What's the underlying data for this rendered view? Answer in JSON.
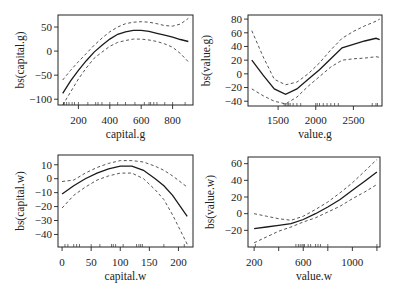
{
  "chart_data": [
    {
      "type": "line",
      "panel": "top-left",
      "title": "",
      "xlabel": "capital.g",
      "ylabel": "bs(capital.g)",
      "xticks": [
        200,
        400,
        600,
        800
      ],
      "yticks": [
        -100,
        -50,
        0,
        50
      ],
      "xlim": [
        70,
        930
      ],
      "ylim": [
        -112,
        75
      ],
      "grid": false,
      "series": [
        {
          "name": "fit",
          "x": [
            100,
            150,
            200,
            250,
            300,
            350,
            400,
            450,
            500,
            550,
            600,
            650,
            700,
            750,
            800,
            850,
            900
          ],
          "values": [
            -88,
            -62,
            -40,
            -20,
            -2,
            12,
            25,
            35,
            40,
            43,
            43,
            41,
            37,
            33,
            29,
            24,
            20
          ]
        },
        {
          "name": "upper",
          "x": [
            100,
            150,
            200,
            250,
            300,
            350,
            400,
            450,
            500,
            550,
            600,
            650,
            700,
            750,
            800,
            850,
            900
          ],
          "values": [
            -60,
            -40,
            -22,
            -5,
            12,
            27,
            40,
            50,
            57,
            60,
            61,
            60,
            57,
            53,
            52,
            56,
            68
          ]
        },
        {
          "name": "lower",
          "x": [
            100,
            150,
            200,
            250,
            300,
            350,
            400,
            450,
            500,
            550,
            600,
            650,
            700,
            750,
            800,
            850,
            900
          ],
          "values": [
            -112,
            -85,
            -58,
            -35,
            -15,
            -2,
            10,
            18,
            22,
            25,
            25,
            23,
            20,
            15,
            8,
            -5,
            -22
          ]
        }
      ],
      "rug": [
        105,
        110,
        125,
        140,
        160,
        175,
        200,
        260,
        310,
        325,
        350,
        400,
        450,
        500,
        560,
        620,
        650,
        660,
        680,
        700,
        750,
        800,
        880
      ]
    },
    {
      "type": "line",
      "panel": "top-right",
      "title": "",
      "xlabel": "value.g",
      "ylabel": "bs(value.g)",
      "xticks": [
        1500,
        2000,
        2500
      ],
      "yticks": [
        -40,
        -20,
        0,
        20,
        40,
        60,
        80
      ],
      "xlim": [
        1100,
        2880
      ],
      "ylim": [
        -47,
        86
      ],
      "grid": false,
      "series": [
        {
          "name": "fit",
          "x": [
            1150,
            1300,
            1450,
            1600,
            1750,
            1900,
            2050,
            2200,
            2350,
            2500,
            2650,
            2800,
            2850
          ],
          "values": [
            20,
            -2,
            -22,
            -30,
            -22,
            -8,
            6,
            22,
            38,
            43,
            48,
            52,
            50
          ]
        },
        {
          "name": "upper",
          "x": [
            1150,
            1300,
            1450,
            1600,
            1750,
            1900,
            2050,
            2200,
            2350,
            2500,
            2650,
            2800,
            2850
          ],
          "values": [
            63,
            25,
            -8,
            -16,
            -12,
            0,
            16,
            35,
            52,
            62,
            70,
            77,
            80
          ]
        },
        {
          "name": "lower",
          "x": [
            1150,
            1300,
            1450,
            1600,
            1750,
            1900,
            2050,
            2200,
            2350,
            2500,
            2650,
            2800,
            2850
          ],
          "values": [
            -22,
            -32,
            -40,
            -44,
            -34,
            -18,
            -4,
            10,
            20,
            22,
            23,
            25,
            24
          ]
        }
      ],
      "rug": [
        1580,
        1600,
        1620,
        1640,
        1660,
        1700,
        1750,
        1800,
        2000,
        2020,
        2050,
        2100,
        2150,
        2200,
        2250,
        2300,
        2750,
        2800,
        2820
      ]
    },
    {
      "type": "line",
      "panel": "bottom-left",
      "title": "",
      "xlabel": "capital.w",
      "ylabel": "bs(capital.w)",
      "xticks": [
        0,
        50,
        100,
        150,
        200
      ],
      "yticks": [
        -40,
        -30,
        -20,
        -10,
        0,
        10
      ],
      "xlim": [
        -7,
        225
      ],
      "ylim": [
        -49,
        17
      ],
      "grid": false,
      "series": [
        {
          "name": "fit",
          "x": [
            0,
            20,
            40,
            60,
            80,
            100,
            120,
            140,
            160,
            175,
            190,
            215
          ],
          "values": [
            -11,
            -5,
            0,
            4,
            7,
            9,
            9,
            6,
            0,
            -5,
            -12,
            -27
          ]
        },
        {
          "name": "upper",
          "x": [
            0,
            20,
            40,
            60,
            80,
            100,
            120,
            140,
            160,
            175,
            190,
            215
          ],
          "values": [
            -2,
            -1,
            4,
            8,
            11,
            13,
            13,
            12,
            9,
            6,
            2,
            -6
          ]
        },
        {
          "name": "lower",
          "x": [
            0,
            20,
            40,
            60,
            80,
            100,
            120,
            140,
            160,
            175,
            190,
            215
          ],
          "values": [
            -21,
            -12,
            -6,
            -1,
            2,
            4,
            4,
            0,
            -8,
            -15,
            -26,
            -47
          ]
        }
      ],
      "rug": [
        5,
        10,
        20,
        25,
        30,
        50,
        65,
        85,
        88,
        92,
        105,
        128,
        132,
        135,
        138,
        175,
        210
      ]
    },
    {
      "type": "line",
      "panel": "bottom-right",
      "title": "",
      "xlabel": "value.w",
      "ylabel": "bs(value.w)",
      "xticks": [
        200,
        400,
        600,
        800,
        1000,
        1200
      ],
      "xticklabels": [
        "200",
        "",
        "600",
        "",
        "1000",
        ""
      ],
      "yticks": [
        -20,
        0,
        20,
        40,
        60
      ],
      "xlim": [
        150,
        1225
      ],
      "ylim": [
        -40,
        68
      ],
      "grid": false,
      "series": [
        {
          "name": "fit",
          "x": [
            200,
            300,
            400,
            500,
            600,
            700,
            800,
            900,
            1000,
            1100,
            1200
          ],
          "values": [
            -18,
            -16,
            -14,
            -12,
            -7,
            0,
            8,
            17,
            28,
            39,
            50
          ]
        },
        {
          "name": "upper",
          "x": [
            200,
            300,
            400,
            500,
            600,
            700,
            800,
            900,
            1000,
            1100,
            1200
          ],
          "values": [
            0,
            -3,
            -6,
            -8,
            -3,
            5,
            14,
            25,
            37,
            51,
            65
          ]
        },
        {
          "name": "lower",
          "x": [
            200,
            300,
            400,
            500,
            600,
            700,
            800,
            900,
            1000,
            1100,
            1200
          ],
          "values": [
            -35,
            -28,
            -21,
            -16,
            -10,
            -5,
            2,
            9,
            18,
            26,
            35
          ]
        }
      ],
      "rug": [
        210,
        540,
        560,
        575,
        590,
        600,
        610,
        640,
        660,
        700,
        720,
        740,
        800,
        1200
      ]
    }
  ]
}
